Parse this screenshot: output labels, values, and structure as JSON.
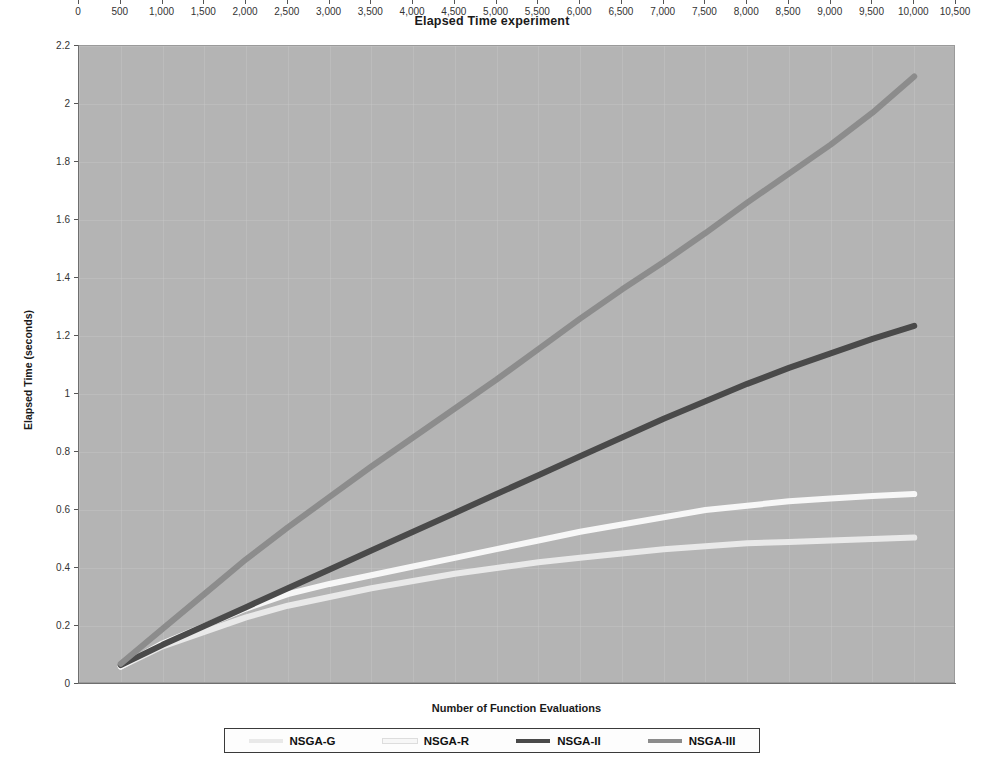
{
  "chart_data": {
    "type": "line",
    "title": "Elapsed Time experiment",
    "xlabel": "Number of Function Evaluations",
    "ylabel": "Elapsed Time (seconds)",
    "xlim": [
      0,
      10500
    ],
    "ylim": [
      0,
      2.2
    ],
    "grid": true,
    "legend_position": "bottom",
    "x_ticks": [
      0,
      500,
      1000,
      1500,
      2000,
      2500,
      3000,
      3500,
      4000,
      4500,
      5000,
      5500,
      6000,
      6500,
      7000,
      7500,
      8000,
      8500,
      9000,
      9500,
      10000,
      10500
    ],
    "x_tick_labels": [
      "0",
      "500",
      "1,000",
      "1,500",
      "2,000",
      "2,500",
      "3,000",
      "3,500",
      "4,000",
      "4,500",
      "5,000",
      "5,500",
      "6,000",
      "6,500",
      "7,000",
      "7,500",
      "8,000",
      "8,500",
      "9,000",
      "9,500",
      "10,000",
      "10,500"
    ],
    "y_ticks": [
      0,
      0.2,
      0.4,
      0.6,
      0.8,
      1.0,
      1.2,
      1.4,
      1.6,
      1.8,
      2.0,
      2.2
    ],
    "y_tick_labels": [
      "0",
      "0.2",
      "0.4",
      "0.6",
      "0.8",
      "1",
      "1.2",
      "1.4",
      "1.6",
      "1.8",
      "2",
      "2.2"
    ],
    "x": [
      500,
      1000,
      1500,
      2000,
      2500,
      3000,
      3500,
      4000,
      4500,
      5000,
      5500,
      6000,
      6500,
      7000,
      7500,
      8000,
      8500,
      9000,
      9500,
      10000
    ],
    "series": [
      {
        "name": "NSGA-G",
        "color": "#e9e9e9",
        "values": [
          0.06,
          0.13,
          0.18,
          0.23,
          0.27,
          0.3,
          0.33,
          0.355,
          0.38,
          0.4,
          0.42,
          0.435,
          0.45,
          0.465,
          0.475,
          0.485,
          0.49,
          0.495,
          0.5,
          0.505
        ]
      },
      {
        "name": "NSGA-R",
        "color": "#f7f7f7",
        "values": [
          0.06,
          0.14,
          0.2,
          0.26,
          0.31,
          0.345,
          0.375,
          0.405,
          0.435,
          0.465,
          0.495,
          0.525,
          0.55,
          0.575,
          0.6,
          0.615,
          0.63,
          0.64,
          0.648,
          0.655
        ]
      },
      {
        "name": "NSGA-II",
        "color": "#4a4a4a",
        "values": [
          0.065,
          0.135,
          0.2,
          0.265,
          0.33,
          0.395,
          0.46,
          0.525,
          0.59,
          0.655,
          0.72,
          0.785,
          0.85,
          0.915,
          0.975,
          1.035,
          1.09,
          1.14,
          1.19,
          1.235
        ]
      },
      {
        "name": "NSGA-III",
        "color": "#8c8c8c",
        "values": [
          0.07,
          0.19,
          0.31,
          0.43,
          0.54,
          0.645,
          0.75,
          0.85,
          0.95,
          1.05,
          1.155,
          1.26,
          1.36,
          1.455,
          1.555,
          1.66,
          1.76,
          1.86,
          1.97,
          2.095
        ]
      }
    ]
  },
  "legend": {
    "items": [
      {
        "label": "NSGA-G"
      },
      {
        "label": "NSGA-R"
      },
      {
        "label": "NSGA-II"
      },
      {
        "label": "NSGA-III"
      }
    ]
  }
}
